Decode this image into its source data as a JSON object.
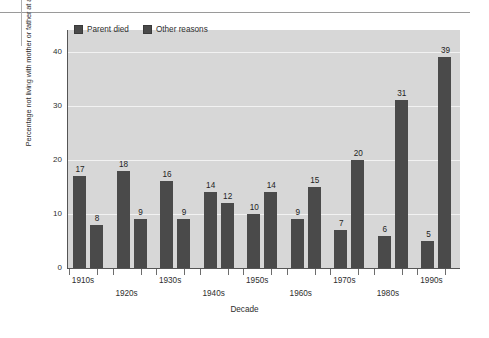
{
  "chart_data": {
    "type": "bar",
    "title": "",
    "xlabel": "Decade",
    "ylabel": "Percentage not living with mother or father at age 16",
    "categories": [
      "1910s",
      "1920s",
      "1930s",
      "1940s",
      "1950s",
      "1960s",
      "1970s",
      "1980s",
      "1990s"
    ],
    "series": [
      {
        "name": "Parent died",
        "values": [
          17,
          18,
          16,
          14,
          10,
          9,
          7,
          6,
          5
        ]
      },
      {
        "name": "Other reasons",
        "values": [
          8,
          9,
          9,
          12,
          14,
          15,
          20,
          31,
          39
        ]
      }
    ],
    "ylim": [
      0,
      44
    ],
    "yticks": [
      0,
      10,
      20,
      30,
      40
    ],
    "ytick_labels": [
      "0",
      "10",
      "20",
      "30",
      "40"
    ],
    "grid": "horizontal",
    "legend_position": "top-left",
    "colors": {
      "bar": "#4a4a4a",
      "plot_background": "#d7d7d7",
      "gridline": "#f2f2f2",
      "axis": "#555555",
      "text": "#2e2e2e"
    }
  },
  "legend": {
    "items": [
      {
        "label": "Parent died"
      },
      {
        "label": "Other reasons"
      }
    ]
  },
  "axes": {
    "x_title": "Decade",
    "y_title": "Percentage not living with mother or father at age 16"
  }
}
